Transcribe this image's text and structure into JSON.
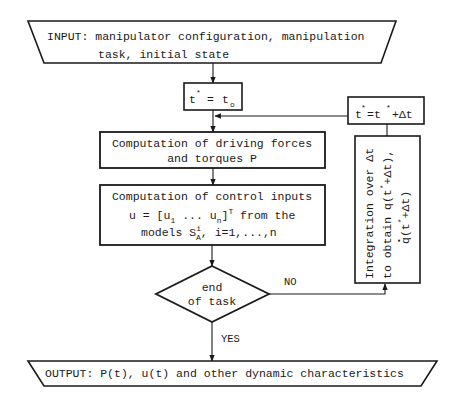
{
  "diagram": {
    "type": "flowchart",
    "colors": {
      "stroke": "#1a1a1a",
      "background": "#ffffff"
    },
    "input": {
      "line1": "INPUT: manipulator configuration, manipulation",
      "line2": "task, initial state"
    },
    "init_box": {
      "lhs": "t",
      "lhs_sup": "*",
      "eq": "=",
      "rhs": "t",
      "rhs_sub": "o"
    },
    "increment_box": {
      "t1": "t",
      "sup1": "*",
      "eq": "=t",
      "sup2": "*",
      "tail": "+Δt"
    },
    "forces_box": {
      "line1": "Computation of driving forces",
      "line2": "and torques P"
    },
    "control_box": {
      "line1": "Computation of control inputs",
      "line2_a": "u = [u",
      "line2_sub1": "1",
      "line2_b": " ... u",
      "line2_subn": "n",
      "line2_c": "]",
      "line2_supT": "T",
      "line2_d": " from the",
      "line3_a": "models S",
      "line3_sup": "i",
      "line3_sub": "A",
      "line3_b": ", i=1,...,n"
    },
    "decision": {
      "line1": "end",
      "line2": "of task",
      "no_label": "NO",
      "yes_label": "YES"
    },
    "integration_box": {
      "line1": "Integration over Δt",
      "line2_a": "to obtain q(t",
      "line2_sup": "*",
      "line2_b": "+Δt),",
      "line3_a": "q(t",
      "line3_sup": "*",
      "line3_b": "+Δt)",
      "line3_dot": "•"
    },
    "output": {
      "text": "OUTPUT: P(t), u(t) and other dynamic characteristics"
    }
  }
}
